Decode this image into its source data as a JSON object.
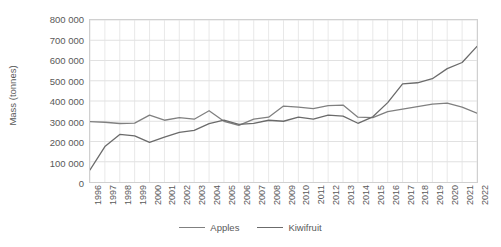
{
  "chart_data": {
    "type": "line",
    "title": "",
    "xlabel": "",
    "ylabel": "Mass (tonnes)",
    "ylim": [
      0,
      800000
    ],
    "ytick_step": 100000,
    "grid": true,
    "legend_position": "bottom",
    "x": [
      1996,
      1997,
      1998,
      1999,
      2000,
      2001,
      2002,
      2003,
      2004,
      2005,
      2006,
      2007,
      2008,
      2009,
      2010,
      2011,
      2012,
      2013,
      2014,
      2015,
      2016,
      2017,
      2018,
      2019,
      2020,
      2021,
      2022
    ],
    "ytick_labels": [
      "800 000",
      "700 000",
      "600 000",
      "500 000",
      "400 000",
      "300 000",
      "200 000",
      "100 000",
      "0"
    ],
    "ytick_values": [
      800000,
      700000,
      600000,
      500000,
      400000,
      300000,
      200000,
      100000,
      0
    ],
    "series": [
      {
        "name": "Apples",
        "color": "#808080",
        "values": [
          298000,
          295000,
          289000,
          291000,
          330000,
          305000,
          318000,
          310000,
          352000,
          300000,
          280000,
          310000,
          320000,
          375000,
          370000,
          362000,
          377000,
          380000,
          320000,
          318000,
          348000,
          360000,
          372000,
          385000,
          390000,
          370000,
          340000
        ]
      },
      {
        "name": "Kiwifruit",
        "color": "#6b6b6b",
        "values": [
          60000,
          175000,
          235000,
          228000,
          196000,
          222000,
          245000,
          255000,
          288000,
          305000,
          285000,
          290000,
          305000,
          300000,
          320000,
          310000,
          330000,
          325000,
          290000,
          322000,
          392000,
          485000,
          490000,
          510000,
          560000,
          590000,
          670000
        ]
      }
    ],
    "legend": [
      {
        "label": "Apples",
        "color": "#808080"
      },
      {
        "label": "Kiwifruit",
        "color": "#6b6b6b"
      }
    ]
  }
}
